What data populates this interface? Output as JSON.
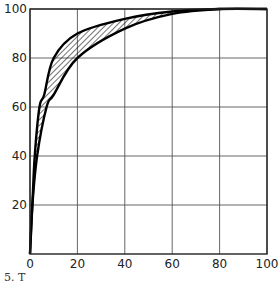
{
  "chart_data": {
    "type": "line",
    "title": "",
    "xlabel": "",
    "ylabel": "",
    "xlim": [
      0,
      100
    ],
    "ylim": [
      0,
      100
    ],
    "grid": true,
    "x_ticks": [
      0,
      20,
      40,
      60,
      80,
      100
    ],
    "y_ticks": [
      20,
      40,
      60,
      80,
      100
    ],
    "legend": null,
    "series": [
      {
        "name": "upper curve",
        "points": [
          [
            0,
            0
          ],
          [
            1,
            20
          ],
          [
            2,
            40
          ],
          [
            4,
            60
          ],
          [
            6,
            65
          ],
          [
            10,
            80
          ],
          [
            20,
            90
          ],
          [
            40,
            96
          ],
          [
            60,
            99
          ],
          [
            80,
            100
          ],
          [
            100,
            100
          ]
        ]
      },
      {
        "name": "lower curve",
        "points": [
          [
            0,
            0
          ],
          [
            1,
            20
          ],
          [
            3,
            40
          ],
          [
            7,
            60
          ],
          [
            10,
            65
          ],
          [
            20,
            80
          ],
          [
            40,
            92
          ],
          [
            60,
            98
          ],
          [
            80,
            100
          ],
          [
            100,
            100
          ]
        ]
      }
    ],
    "fill_between": {
      "upper": "upper curve",
      "lower": "lower curve",
      "pattern": "diagonal-hatch"
    },
    "annotations": []
  },
  "caption": {
    "text": "5. T"
  },
  "plot_geometry": {
    "left": 30,
    "right": 267,
    "top": 9,
    "bottom": 254
  }
}
